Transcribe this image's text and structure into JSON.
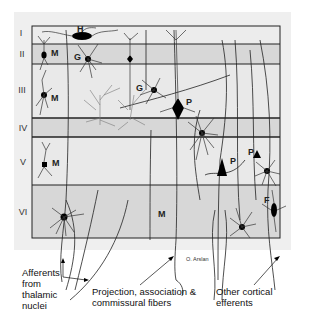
{
  "figure": {
    "credit": "O. Arslan",
    "colors": {
      "outer_bg": "#efefef",
      "layer_light": "#e9e9e9",
      "layer_dark": "#d6d6d6",
      "line": "#222222",
      "soma": "#000000"
    },
    "layers": [
      {
        "numeral": "I",
        "shade": "light"
      },
      {
        "numeral": "II",
        "shade": "dark"
      },
      {
        "numeral": "III",
        "shade": "light"
      },
      {
        "numeral": "IV",
        "shade": "dark"
      },
      {
        "numeral": "V",
        "shade": "light"
      },
      {
        "numeral": "VI",
        "shade": "dark"
      }
    ],
    "cell_labels": {
      "horizontal": "H",
      "martinotti_II": "M",
      "granule_II": "G",
      "martinotti_III": "M",
      "granule_III": "G",
      "pyramidal_III": "P",
      "pyramidal_V_large": "P",
      "pyramidal_V_small": "P",
      "martinotti_V": "M",
      "martinotti_VI": "M",
      "fusiform_VI": "F"
    },
    "captions": {
      "afferents": [
        "Afferents",
        "from",
        "thalamic",
        "nuclei"
      ],
      "projection": [
        "Projection, association &",
        "commissural fibers"
      ],
      "efferents": [
        "Other cortical",
        "efferents"
      ]
    }
  }
}
